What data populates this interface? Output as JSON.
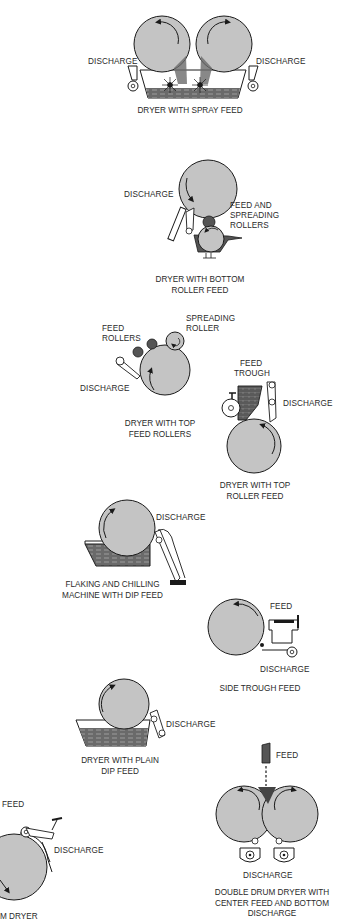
{
  "colors": {
    "drum": "#c4c4c4",
    "outline": "#1a1a1a",
    "liquid": "#6a6a6a",
    "roller_dark": "#555555",
    "text": "#2a2a2a"
  },
  "diagrams": [
    {
      "id": "spray-feed",
      "caption": [
        "DRYER WITH SPRAY FEED"
      ],
      "labels": [
        "DISCHARGE",
        "DISCHARGE"
      ]
    },
    {
      "id": "bottom-roller-feed",
      "caption": [
        "DRYER WITH BOTTOM",
        "ROLLER FEED"
      ],
      "labels": [
        "DISCHARGE",
        "FEED AND",
        "SPREADING",
        "ROLLERS"
      ]
    },
    {
      "id": "top-feed-rollers",
      "caption": [
        "DRYER WITH TOP",
        "FEED ROLLERS"
      ],
      "labels": [
        "SPREADING",
        "ROLLER",
        "FEED",
        "ROLLERS",
        "DISCHARGE"
      ]
    },
    {
      "id": "top-roller-feed",
      "caption": [
        "DRYER WITH TOP",
        "ROLLER FEED"
      ],
      "labels": [
        "FEED",
        "TROUGH",
        "DISCHARGE"
      ]
    },
    {
      "id": "flaking-chilling",
      "caption": [
        "FLAKING AND CHILLING",
        "MACHINE WITH DIP FEED"
      ],
      "labels": [
        "DISCHARGE"
      ]
    },
    {
      "id": "side-trough-feed",
      "caption": [
        "SIDE TROUGH FEED"
      ],
      "labels": [
        "FEED",
        "DISCHARGE"
      ]
    },
    {
      "id": "plain-dip-feed",
      "caption": [
        "DRYER WITH PLAIN",
        "DIP FEED"
      ],
      "labels": [
        "DISCHARGE"
      ]
    },
    {
      "id": "single-drum",
      "caption": [
        "M DRYER"
      ],
      "labels": [
        "FEED",
        "DISCHARGE"
      ]
    },
    {
      "id": "double-drum-center-feed",
      "caption": [
        "DOUBLE DRUM DRYER WITH",
        "CENTER FEED AND BOTTOM",
        "DISCHARGE"
      ],
      "labels": [
        "FEED",
        "DISCHARGE"
      ]
    }
  ]
}
